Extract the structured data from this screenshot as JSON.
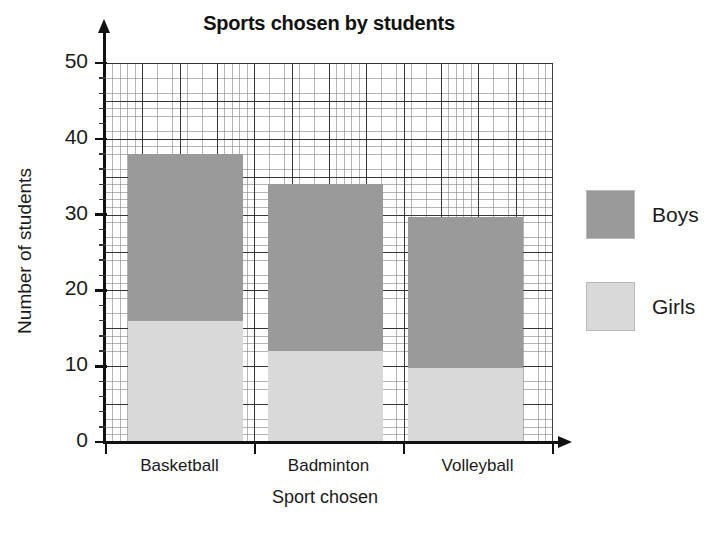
{
  "chart_data": {
    "type": "bar",
    "subtype": "stacked",
    "title": "Sports chosen by students",
    "xlabel": "Sport chosen",
    "ylabel": "Number of students",
    "categories": [
      "Basketball",
      "Badminton",
      "Volleyball"
    ],
    "series": [
      {
        "name": "Girls",
        "values": [
          16,
          12,
          9.7
        ],
        "color": "#d9d9d9"
      },
      {
        "name": "Boys",
        "values": [
          22,
          22,
          20
        ],
        "color": "#9a9a9a"
      }
    ],
    "totals": [
      38,
      34,
      29.7
    ],
    "ylim": [
      0,
      50
    ],
    "yticks": [
      0,
      10,
      20,
      30,
      40,
      50
    ],
    "ytick_labels": [
      "0",
      "10",
      "20",
      "30",
      "40",
      "50"
    ],
    "minor_tick_step": 2,
    "grid": true,
    "legend_position": "right",
    "legend_entries": [
      "Boys",
      "Girls"
    ]
  },
  "axes": {
    "y_title": "Number of students",
    "x_title": "Sport chosen"
  },
  "legend": {
    "items": [
      {
        "label": "Boys",
        "color": "#9a9a9a"
      },
      {
        "label": "Girls",
        "color": "#d9d9d9"
      }
    ]
  }
}
